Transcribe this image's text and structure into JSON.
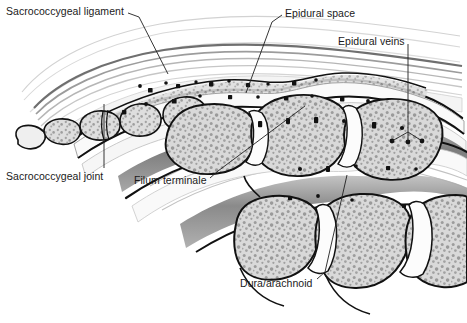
{
  "figure": {
    "kind": "medical-illustration",
    "style": "grayscale line drawing with stippled bone",
    "width": 467,
    "height": 323,
    "background": "#ffffff"
  },
  "palette": {
    "background": "#ffffff",
    "ink": "#111111",
    "label_text": "#1a1a1a",
    "leader_line": "#1f1f1f",
    "bone_fill": "#d8d8d8",
    "bone_speckle": "#9a9a9a",
    "bone_rim": "#efefef",
    "disc_fill": "#fbfbfb",
    "canal_fill": "#f7f7f7",
    "cord_gray": "#808080",
    "cord_gray_dark": "#6e6e6e",
    "ligament_gray": "#b4b4b4",
    "skin_line": "#cfcfcf",
    "vein_dot": "#111111"
  },
  "labels": [
    {
      "id": "sacrococcygeal-ligament",
      "text": "Sacrococcygeal ligament",
      "x": 6,
      "y": 6,
      "leader": [
        [
          128,
          13
        ],
        [
          139,
          17
        ],
        [
          168,
          74
        ]
      ]
    },
    {
      "id": "epidural-space",
      "text": "Epidural space",
      "x": 285,
      "y": 8,
      "leader": [
        [
          282,
          15
        ],
        [
          272,
          22
        ],
        [
          246,
          93
        ]
      ]
    },
    {
      "id": "epidural-veins",
      "text": "Epidural veins",
      "x": 338,
      "y": 36,
      "leader": [
        [
          408,
          44
        ],
        [
          408,
          132
        ]
      ],
      "branches": [
        [
          [
            408,
            132
          ],
          [
            392,
            141
          ]
        ],
        [
          [
            408,
            132
          ],
          [
            408,
            142
          ]
        ],
        [
          [
            408,
            132
          ],
          [
            422,
            141
          ]
        ]
      ]
    },
    {
      "id": "sacrococcygeal-joint",
      "text": "Sacrococcygeal joint",
      "x": 6,
      "y": 171,
      "leader": [
        [
          104,
          168
        ],
        [
          104,
          104
        ]
      ]
    },
    {
      "id": "filum-terminale",
      "text": "Filum terminale",
      "x": 134,
      "y": 175,
      "leader": [
        [
          210,
          178
        ],
        [
          218,
          171
        ],
        [
          305,
          106
        ]
      ]
    },
    {
      "id": "dura-arachnoid",
      "text": "Dura/arachnoid",
      "x": 240,
      "y": 278,
      "leader": [
        [
          317,
          279
        ],
        [
          325,
          272
        ],
        [
          347,
          175
        ]
      ]
    }
  ],
  "anatomy": {
    "coccygeal_segments": 5,
    "sacral_bodies": 3,
    "lumbar_bodies": 3,
    "epidural_vein_count": 34,
    "skin_contour_lines": 3,
    "ligament_bands": 5
  }
}
